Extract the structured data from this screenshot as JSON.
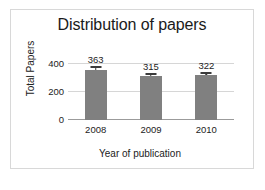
{
  "chart_data": {
    "type": "bar",
    "title": "Distribution of papers",
    "xlabel": "Year of publication",
    "ylabel": "Total Papers",
    "categories": [
      "2008",
      "2009",
      "2010"
    ],
    "values": [
      363,
      315,
      322
    ],
    "data_labels": [
      "363",
      "315",
      "322"
    ],
    "errors": [
      12,
      10,
      11
    ],
    "ylim": [
      0,
      460
    ],
    "yticks": [
      0,
      200,
      400
    ],
    "ytick_labels": [
      "400",
      "200",
      "0"
    ],
    "grid": "horizontal",
    "legend": "none",
    "bar_color": "#808080",
    "gridline_color": "#d6d6d6",
    "axis_color": "#9b9b9b",
    "text_color": "#222222",
    "frame_color": "#d8d8d8",
    "background": "#ffffff"
  }
}
